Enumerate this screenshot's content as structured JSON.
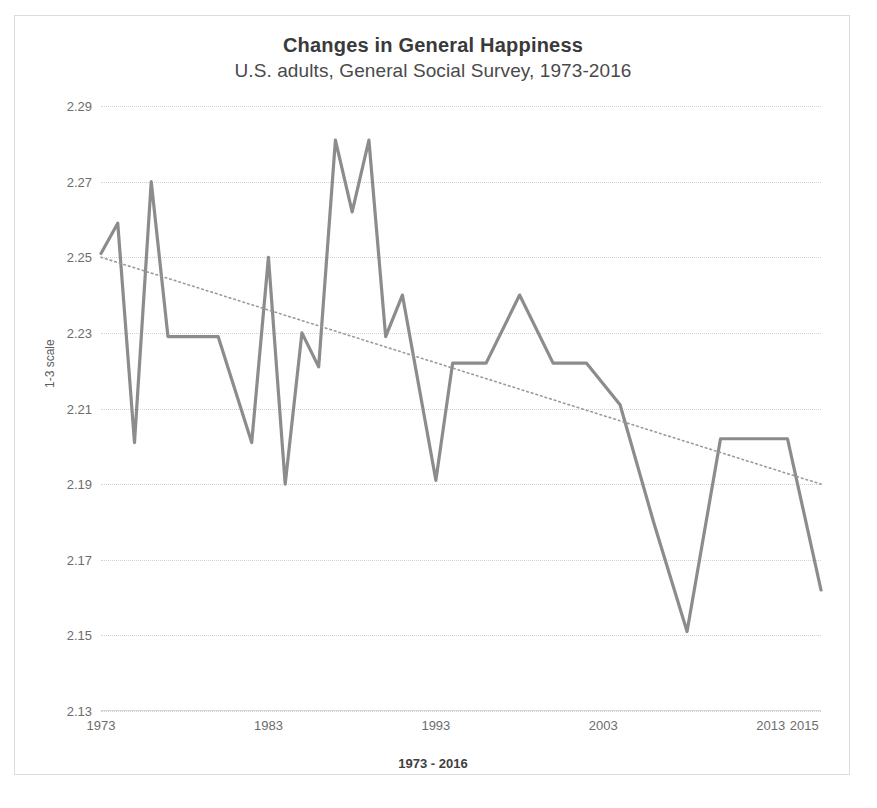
{
  "chart_data": {
    "type": "line",
    "title": "Changes in General Happiness",
    "subtitle": "U.S. adults, General Social Survey, 1973-2016",
    "xlabel": "1973 - 2016",
    "ylabel": "1-3 scale",
    "ylim": [
      2.13,
      2.29
    ],
    "xlim": [
      1973,
      2016
    ],
    "ytick_labels": [
      "2.29",
      "2.27",
      "2.25",
      "2.23",
      "2.21",
      "2.19",
      "2.17",
      "2.15",
      "2.13"
    ],
    "ytick_values": [
      2.29,
      2.27,
      2.25,
      2.23,
      2.21,
      2.19,
      2.17,
      2.15,
      2.13
    ],
    "xtick_labels": [
      "1973",
      "1983",
      "1993",
      "2003",
      "2013",
      "2015"
    ],
    "xtick_values": [
      1973,
      1983,
      1993,
      2003,
      2013,
      2015
    ],
    "grid": true,
    "legend": "none",
    "series": [
      {
        "name": "General happiness mean",
        "style": "solid",
        "color": "#8c8c8c",
        "x": [
          1973,
          1974,
          1975,
          1976,
          1977,
          1978,
          1980,
          1982,
          1983,
          1984,
          1985,
          1986,
          1987,
          1988,
          1989,
          1990,
          1991,
          1993,
          1994,
          1996,
          1998,
          2000,
          2002,
          2004,
          2006,
          2008,
          2010,
          2012,
          2014,
          2016
        ],
        "y": [
          2.251,
          2.259,
          2.201,
          2.27,
          2.229,
          2.229,
          2.229,
          2.201,
          2.25,
          2.19,
          2.23,
          2.221,
          2.281,
          2.262,
          2.281,
          2.229,
          2.24,
          2.191,
          2.222,
          2.222,
          2.24,
          2.222,
          2.222,
          2.211,
          2.18,
          2.151,
          2.202,
          2.202,
          2.202,
          2.162
        ]
      },
      {
        "name": "Linear trend",
        "style": "dotted",
        "color": "#9a9a9a",
        "x": [
          1973,
          2016
        ],
        "y": [
          2.25,
          2.19
        ]
      }
    ]
  },
  "frame": {
    "border_color": "#dcdcdc",
    "background": "#ffffff"
  }
}
